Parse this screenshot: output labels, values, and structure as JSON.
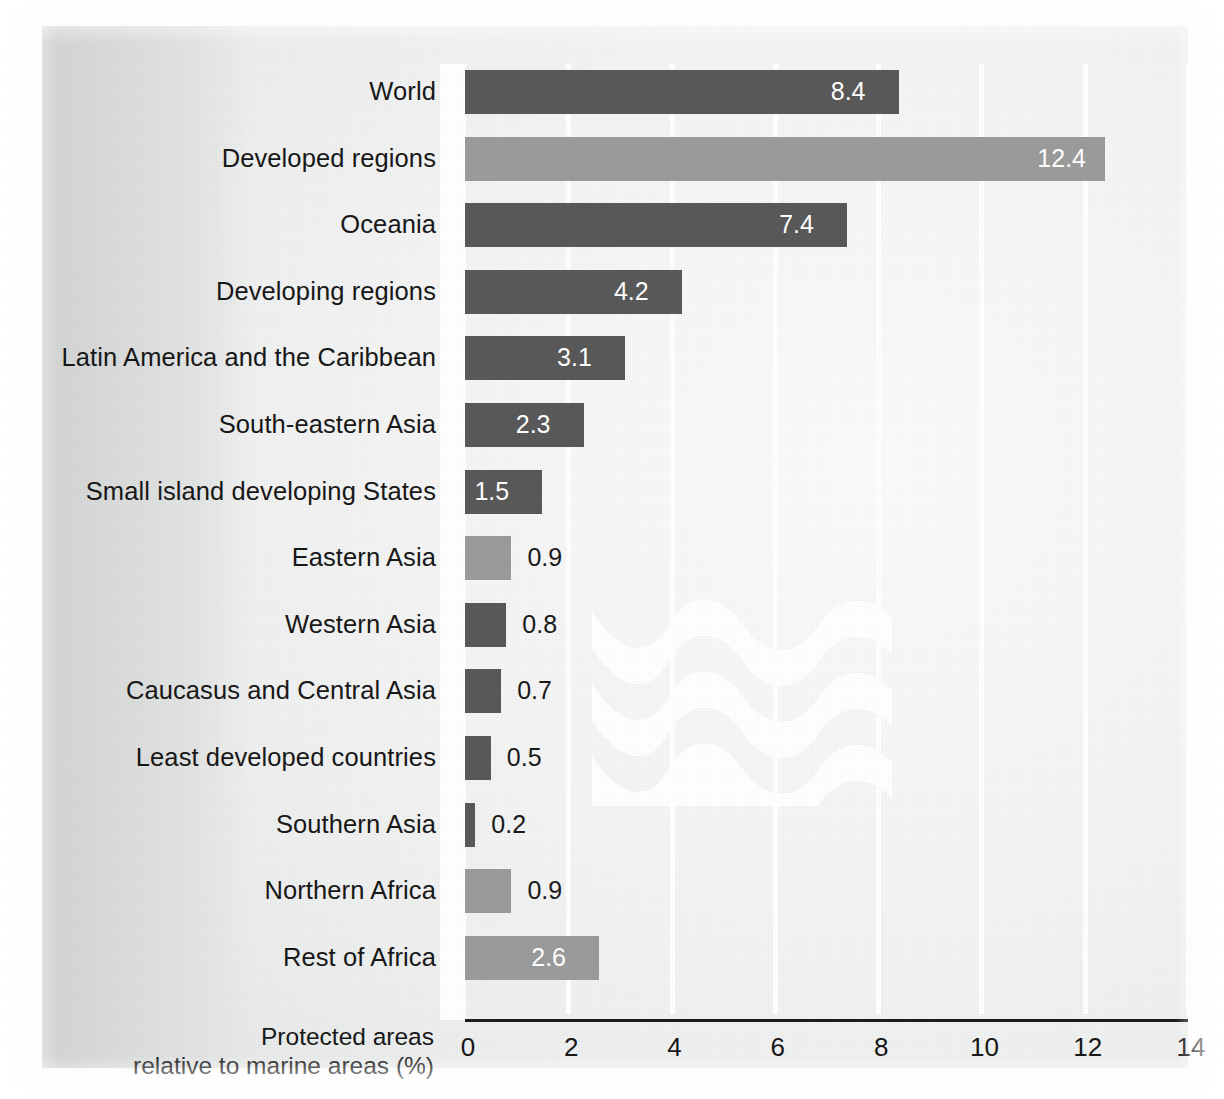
{
  "chart_data": {
    "type": "bar",
    "orientation": "horizontal",
    "title": "",
    "xlabel": "Protected areas relative to marine areas (%)",
    "xlabel_line1": "Protected areas",
    "xlabel_line2": "relative to marine areas (%)",
    "ylabel": "",
    "xlim": [
      0,
      14
    ],
    "xticks": [
      "0",
      "2",
      "4",
      "6",
      "8",
      "10",
      "12",
      "14"
    ],
    "xtick_values": [
      0,
      2,
      4,
      6,
      8,
      10,
      12,
      14
    ],
    "grid": "vertical-white",
    "legend": "none",
    "categories": [
      "World",
      "Developed regions",
      "Oceania",
      "Developing regions",
      "Latin America and the Caribbean",
      "South-eastern Asia",
      "Small island developing States",
      "Eastern Asia",
      "Western Asia",
      "Caucasus and Central Asia",
      "Least developed countries",
      "Southern Asia",
      "Northern Africa",
      "Rest of Africa"
    ],
    "values": [
      8.4,
      12.4,
      7.4,
      4.2,
      3.1,
      2.3,
      1.5,
      0.9,
      0.8,
      0.7,
      0.5,
      0.2,
      0.9,
      2.6
    ],
    "value_labels": [
      "8.4",
      "12.4",
      "7.4",
      "4.2",
      "3.1",
      "2.3",
      "1.5",
      "0.9",
      "0.8",
      "0.7",
      "0.5",
      "0.2",
      "0.9",
      "2.6"
    ],
    "bar_shades": [
      "dark",
      "light",
      "dark",
      "dark",
      "dark",
      "dark",
      "dark",
      "light",
      "dark",
      "dark",
      "dark",
      "dark",
      "light",
      "light"
    ],
    "label_placement": [
      "inside",
      "inside",
      "inside",
      "inside",
      "inside",
      "inside",
      "inside",
      "outside",
      "outside",
      "outside",
      "outside",
      "outside",
      "outside",
      "inside"
    ],
    "colors": {
      "bar_dark": "#595959",
      "bar_light": "#9b9b9b",
      "gridline": "#ffffff",
      "axis_line": "#1d1d1d",
      "text": "#181818",
      "value_inside": "#ffffff",
      "background": "#e8e9e9",
      "wave": "#ffffff"
    },
    "decoration": "white wave motif overlaying plot area"
  },
  "rows": [
    {
      "label": "World",
      "value": "8.4",
      "v": 8.4,
      "shade": "dark",
      "place": "inside"
    },
    {
      "label": "Developed regions",
      "value": "12.4",
      "v": 12.4,
      "shade": "light",
      "place": "inside"
    },
    {
      "label": "Oceania",
      "value": "7.4",
      "v": 7.4,
      "shade": "dark",
      "place": "inside"
    },
    {
      "label": "Developing regions",
      "value": "4.2",
      "v": 4.2,
      "shade": "dark",
      "place": "inside"
    },
    {
      "label": "Latin America and the Caribbean",
      "value": "3.1",
      "v": 3.1,
      "shade": "dark",
      "place": "inside"
    },
    {
      "label": "South-eastern Asia",
      "value": "2.3",
      "v": 2.3,
      "shade": "dark",
      "place": "inside"
    },
    {
      "label": "Small island developing States",
      "value": "1.5",
      "v": 1.5,
      "shade": "dark",
      "place": "inside"
    },
    {
      "label": "Eastern Asia",
      "value": "0.9",
      "v": 0.9,
      "shade": "light",
      "place": "outside"
    },
    {
      "label": "Western Asia",
      "value": "0.8",
      "v": 0.8,
      "shade": "dark",
      "place": "outside"
    },
    {
      "label": "Caucasus and Central Asia",
      "value": "0.7",
      "v": 0.7,
      "shade": "dark",
      "place": "outside"
    },
    {
      "label": "Least developed countries",
      "value": "0.5",
      "v": 0.5,
      "shade": "dark",
      "place": "outside"
    },
    {
      "label": "Southern Asia",
      "value": "0.2",
      "v": 0.2,
      "shade": "dark",
      "place": "outside"
    },
    {
      "label": "Northern Africa",
      "value": "0.9",
      "v": 0.9,
      "shade": "light",
      "place": "outside"
    },
    {
      "label": "Rest of Africa",
      "value": "2.6",
      "v": 2.6,
      "shade": "light",
      "place": "inside"
    }
  ],
  "axis": {
    "ticks": [
      "0",
      "2",
      "4",
      "6",
      "8",
      "10",
      "12",
      "14"
    ],
    "title_line1": "Protected areas",
    "title_line2": "relative to marine areas (%)"
  }
}
